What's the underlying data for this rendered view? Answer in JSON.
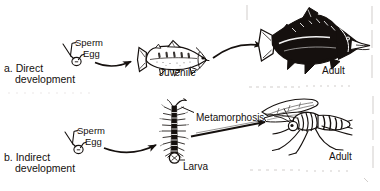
{
  "figure": {
    "width": 380,
    "height": 191,
    "ink_color": "#15100e",
    "background_color": "#ffffff",
    "style": "black-and-white scanned textbook line drawing"
  },
  "rows": [
    {
      "id": "direct",
      "marker": "a.",
      "heading_line1": "Direct",
      "heading_line2": "development",
      "gametes": {
        "sperm_label": "Sperm",
        "egg_label": "Egg"
      },
      "stages": [
        {
          "name": "egg-with-sperm",
          "label": ""
        },
        {
          "name": "juvenile-fish",
          "label": "Juvenile"
        },
        {
          "name": "adult-fish",
          "label": "Adult"
        }
      ],
      "arrow_labels": []
    },
    {
      "id": "indirect",
      "marker": "b.",
      "heading_line1": "Indirect",
      "heading_line2": "development",
      "gametes": {
        "sperm_label": "Sperm",
        "egg_label": "Egg"
      },
      "stages": [
        {
          "name": "egg-with-sperm",
          "label": ""
        },
        {
          "name": "caterpillar-larva",
          "label": "Larva"
        },
        {
          "name": "adult-insect",
          "label": "Adult"
        }
      ],
      "arrow_labels": [
        "Metamorphosis"
      ]
    }
  ],
  "labels": {
    "sperm_a": "Sperm",
    "egg_a": "Egg",
    "sperm_b": "Sperm",
    "egg_b": "Egg",
    "juvenile": "Juvenile",
    "adult_fish": "Adult",
    "larva": "Larva",
    "metamorphosis": "Metamorphosis",
    "adult_insect": "Adult",
    "marker_a": "a.",
    "heading_a_1": "Direct",
    "heading_a_2": "development",
    "marker_b": "b.",
    "heading_b_1": "Indirect",
    "heading_b_2": "development"
  }
}
